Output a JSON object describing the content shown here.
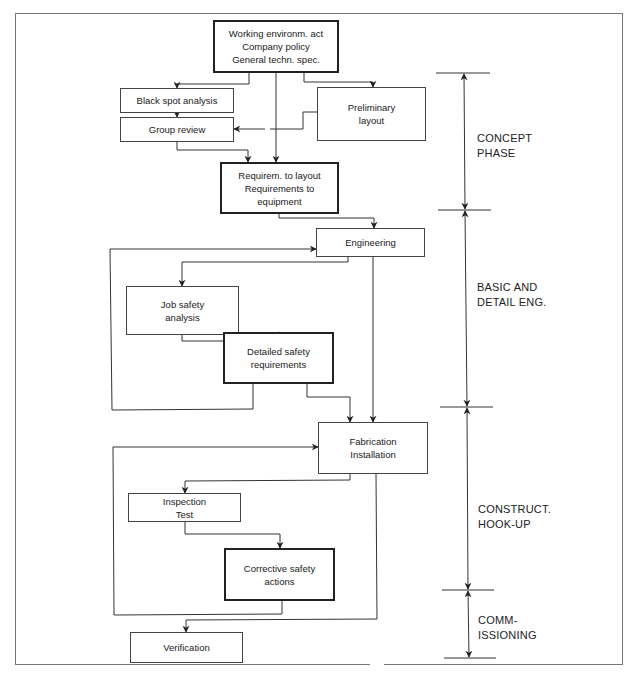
{
  "diagram": {
    "nodes": {
      "inputs": {
        "lines": [
          "Working environm. act",
          "Company policy",
          "General techn. spec."
        ],
        "emphasis": "thick"
      },
      "black_spot": {
        "lines": [
          "Black spot analysis"
        ]
      },
      "group_review": {
        "lines": [
          "Group review"
        ]
      },
      "preliminary_layout": {
        "lines": [
          "Preliminary",
          "layout"
        ]
      },
      "requirements": {
        "lines": [
          "Requirem. to layout",
          "Requirements to",
          "equipment"
        ],
        "emphasis": "thick"
      },
      "engineering": {
        "lines": [
          "Engineering"
        ]
      },
      "job_safety": {
        "lines": [
          "Job safety",
          "analysis"
        ]
      },
      "detailed_safety": {
        "lines": [
          "Detailed safety",
          "requirements"
        ],
        "emphasis": "thick"
      },
      "fabrication": {
        "lines": [
          "Fabrication",
          "Installation"
        ]
      },
      "inspection": {
        "lines": [
          "Inspection",
          "Test"
        ]
      },
      "corrective": {
        "lines": [
          "Corrective safety",
          "actions"
        ],
        "emphasis": "thick"
      },
      "verification": {
        "lines": [
          "Verification"
        ]
      }
    },
    "phases": [
      {
        "lines": [
          "CONCEPT",
          "PHASE"
        ]
      },
      {
        "lines": [
          "BASIC AND",
          "DETAIL ENG."
        ]
      },
      {
        "lines": [
          "CONSTRUCT.",
          "HOOK-UP"
        ]
      },
      {
        "lines": [
          "COMM-",
          "ISSIONING"
        ]
      }
    ],
    "edges": [
      [
        "inputs",
        "black_spot"
      ],
      [
        "inputs",
        "requirements"
      ],
      [
        "inputs",
        "preliminary_layout"
      ],
      [
        "black_spot",
        "group_review"
      ],
      [
        "preliminary_layout",
        "group_review"
      ],
      [
        "group_review",
        "requirements"
      ],
      [
        "requirements",
        "engineering"
      ],
      [
        "engineering",
        "job_safety"
      ],
      [
        "engineering",
        "fabrication"
      ],
      [
        "job_safety",
        "detailed_safety"
      ],
      [
        "detailed_safety",
        "engineering"
      ],
      [
        "detailed_safety",
        "fabrication"
      ],
      [
        "fabrication",
        "inspection"
      ],
      [
        "fabrication",
        "verification"
      ],
      [
        "inspection",
        "corrective"
      ],
      [
        "corrective",
        "fabrication"
      ]
    ],
    "caption": "Fig. ... Simplified model for accident prevention in design"
  }
}
